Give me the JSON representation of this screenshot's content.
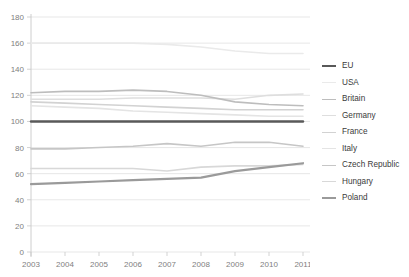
{
  "top_cut_caption": "",
  "axes": {
    "y_ticks": [
      0,
      20,
      40,
      60,
      80,
      100,
      120,
      140,
      160,
      180
    ],
    "x_ticks": [
      "2003",
      "2004",
      "2005",
      "2006",
      "2007",
      "2008",
      "2009",
      "2010",
      "2011"
    ],
    "y_min": 0,
    "y_max": 180,
    "grid": true,
    "axis_color": "#c8c8c8",
    "grid_color": "#dcdcdc",
    "tick_text_color": "#808080"
  },
  "legend": {
    "position": "right",
    "items": [
      {
        "label": "EU",
        "color": "#595959",
        "width": 2.4
      },
      {
        "label": "USA",
        "color": "#eaeaea",
        "width": 1.6
      },
      {
        "label": "Britain",
        "color": "#bdbdbd",
        "width": 1.6
      },
      {
        "label": "Germany",
        "color": "#dedede",
        "width": 1.6
      },
      {
        "label": "France",
        "color": "#d2d2d2",
        "width": 1.6
      },
      {
        "label": "Italy",
        "color": "#e4e4e4",
        "width": 1.6
      },
      {
        "label": "Czech Republic",
        "color": "#c6c6c6",
        "width": 1.6
      },
      {
        "label": "Hungary",
        "color": "#d8d8d8",
        "width": 1.6
      },
      {
        "label": "Poland",
        "color": "#9a9a9a",
        "width": 2.2
      }
    ]
  },
  "chart_data": {
    "type": "line",
    "title": "",
    "subtitle": "",
    "xlabel": "",
    "ylabel": "",
    "ylim": [
      0,
      180
    ],
    "ytick_step": 20,
    "grid": true,
    "legend_position": "right",
    "x": [
      "2003",
      "2004",
      "2005",
      "2006",
      "2007",
      "2008",
      "2009",
      "2010",
      "2011"
    ],
    "series": [
      {
        "name": "EU",
        "color": "#595959",
        "width": 2.4,
        "values": [
          100,
          100,
          100,
          100,
          100,
          100,
          100,
          100,
          100
        ]
      },
      {
        "name": "USA",
        "color": "#eaeaea",
        "width": 1.6,
        "values": [
          160,
          160,
          160,
          160,
          159,
          157,
          154,
          152,
          152
        ]
      },
      {
        "name": "Britain",
        "color": "#bdbdbd",
        "width": 1.6,
        "values": [
          122,
          123,
          123,
          124,
          123,
          120,
          115,
          113,
          112
        ]
      },
      {
        "name": "Germany",
        "color": "#dedede",
        "width": 1.6,
        "values": [
          117,
          117,
          117,
          118,
          118,
          118,
          117,
          120,
          121
        ]
      },
      {
        "name": "France",
        "color": "#d2d2d2",
        "width": 1.6,
        "values": [
          115,
          114,
          113,
          112,
          111,
          110,
          109,
          109,
          109
        ]
      },
      {
        "name": "Italy",
        "color": "#e4e4e4",
        "width": 1.6,
        "values": [
          112,
          111,
          110,
          108,
          107,
          106,
          105,
          104,
          104
        ]
      },
      {
        "name": "Czech Republic",
        "color": "#c6c6c6",
        "width": 1.6,
        "values": [
          79,
          79,
          80,
          81,
          83,
          81,
          84,
          84,
          81
        ]
      },
      {
        "name": "Hungary",
        "color": "#d8d8d8",
        "width": 1.6,
        "values": [
          64,
          64,
          64,
          64,
          62,
          65,
          66,
          66,
          67
        ]
      },
      {
        "name": "Poland",
        "color": "#9a9a9a",
        "width": 2.2,
        "values": [
          52,
          53,
          54,
          55,
          56,
          57,
          62,
          65,
          68
        ]
      }
    ]
  }
}
